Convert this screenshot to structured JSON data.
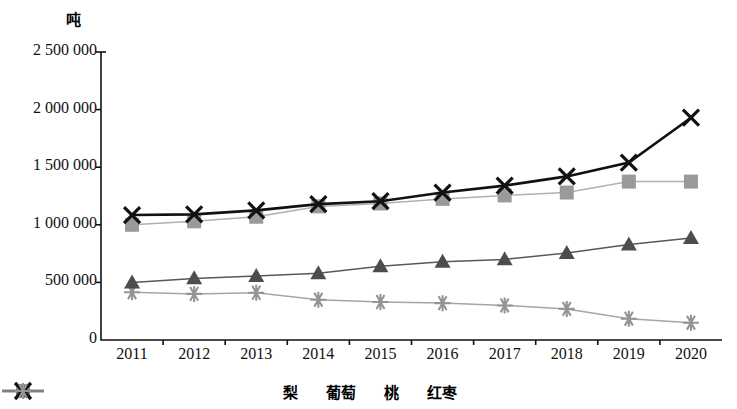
{
  "chart_data": {
    "type": "line",
    "title": "",
    "subtitle": "",
    "xlabel": "",
    "ylabel": "吨",
    "unit_label": "吨",
    "categories": [
      "2011",
      "2012",
      "2013",
      "2014",
      "2015",
      "2016",
      "2017",
      "2018",
      "2019",
      "2020"
    ],
    "ylim": [
      0,
      2500000
    ],
    "ytick_labels": [
      "2 500 000",
      "2 000 000",
      "1 500 000",
      "1 000 000",
      "500 000",
      "0"
    ],
    "ytick_values": [
      2500000,
      2000000,
      1500000,
      1000000,
      500000,
      0
    ],
    "grid": false,
    "legend_position": "bottom",
    "series": [
      {
        "name": "梨",
        "marker": "square",
        "color": "#9a9a9a",
        "line_color": "#b0b0b0",
        "values": [
          1000000,
          1030000,
          1070000,
          1160000,
          1185000,
          1225000,
          1255000,
          1280000,
          1375000,
          1375000
        ]
      },
      {
        "name": "葡萄",
        "marker": "triangle",
        "color": "#4d4d4d",
        "line_color": "#585858",
        "values": [
          500000,
          535000,
          555000,
          580000,
          640000,
          680000,
          700000,
          755000,
          830000,
          885000
        ]
      },
      {
        "name": "桃",
        "marker": "x",
        "color": "#111111",
        "line_color": "#111111",
        "values": [
          1085000,
          1090000,
          1125000,
          1180000,
          1205000,
          1280000,
          1340000,
          1420000,
          1540000,
          1930000
        ]
      },
      {
        "name": "红枣",
        "marker": "asterisk",
        "color": "#949494",
        "line_color": "#a5a5a5",
        "values": [
          415000,
          400000,
          410000,
          350000,
          330000,
          320000,
          300000,
          270000,
          185000,
          150000
        ]
      }
    ]
  },
  "legend": {
    "items": [
      {
        "label": "梨"
      },
      {
        "label": "葡萄"
      },
      {
        "label": "桃"
      },
      {
        "label": "红枣"
      }
    ]
  },
  "axes": {
    "y_unit": "吨"
  }
}
